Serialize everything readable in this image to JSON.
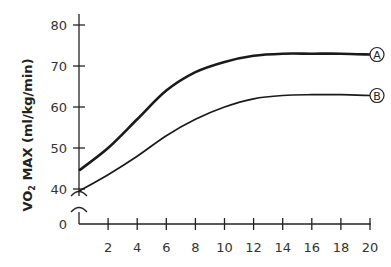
{
  "chart_data": {
    "type": "line",
    "title": "",
    "xlabel": "",
    "ylabel": "VO2 MAX (ml/kg/min)",
    "ylabel_main": "VO",
    "ylabel_sub": "2",
    "ylabel_rest": " MAX (ml/kg/min)",
    "xlim": [
      0,
      20
    ],
    "ylim": [
      0,
      80
    ],
    "axis_break": "between 0 and 40 on y-axis",
    "x_ticks": [
      2,
      4,
      6,
      8,
      10,
      12,
      14,
      16,
      18,
      20
    ],
    "y_ticks": [
      0,
      40,
      50,
      60,
      70,
      80
    ],
    "grid": false,
    "legend_position": "inline labels at right end of curves",
    "x": [
      0,
      2,
      4,
      6,
      8,
      10,
      12,
      14,
      16,
      18,
      20
    ],
    "series": [
      {
        "name": "A",
        "values": [
          44.5,
          50,
          57,
          64,
          68.5,
          71,
          72.5,
          73,
          73,
          73,
          72.8
        ]
      },
      {
        "name": "B",
        "values": [
          39.5,
          43.5,
          48,
          53,
          57,
          60,
          62,
          62.8,
          63,
          63,
          62.8
        ]
      }
    ]
  }
}
